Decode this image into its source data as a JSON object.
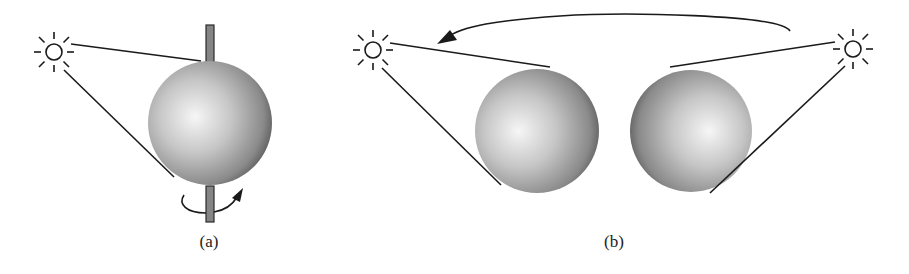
{
  "figure": {
    "panels": [
      {
        "id": "a",
        "label": "(a)",
        "description": "Sphere rotating about a vertical axis, lit by a fixed light source",
        "light_source": {
          "icon": "sun-icon",
          "cx": 54,
          "cy": 52
        },
        "sphere": {
          "cx": 210,
          "cy": 123,
          "r": 62
        },
        "axis": {
          "x": 206,
          "width": 8,
          "y_top": 25,
          "y_bottom": 222
        },
        "rotation_arrow": {
          "icon": "rotation-arrow-icon"
        },
        "label_pos": {
          "x": 209,
          "y": 232
        }
      },
      {
        "id": "b",
        "label": "(b)",
        "description": "Light source moving from right to left around a fixed sphere",
        "light_sources": [
          {
            "icon": "sun-icon",
            "position": "left",
            "cx": 373,
            "cy": 50
          },
          {
            "icon": "sun-icon",
            "position": "right",
            "cx": 853,
            "cy": 49
          }
        ],
        "spheres": [
          {
            "cx": 537,
            "cy": 131,
            "r": 62
          },
          {
            "cx": 691,
            "cy": 131,
            "r": 61
          }
        ],
        "motion_arrow": {
          "icon": "curved-arrow-left-icon",
          "from": "right light",
          "to": "left light"
        },
        "label_pos": {
          "x": 614,
          "y": 232
        }
      }
    ]
  },
  "colors": {
    "line": "#1a1a1a",
    "sphere_highlight": "#f6f6f6",
    "sphere_mid": "#b4b4b4",
    "sphere_edge": "#5c5c5c",
    "axis_fill": "#858585",
    "axis_stroke": "#2a2a2a"
  }
}
